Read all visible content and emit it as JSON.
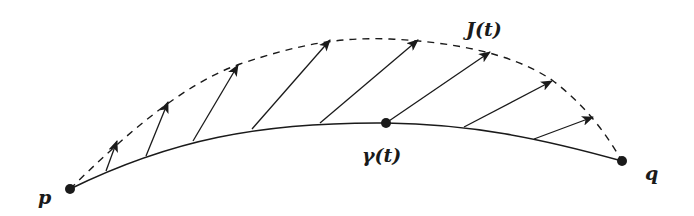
{
  "figure": {
    "colors": {
      "ink": "#1a1a1a",
      "background": "#ffffff"
    },
    "labels": {
      "start_point": "p",
      "end_point": "q",
      "curve_point": "γ(t)",
      "field": "J(t)"
    },
    "curve": {
      "type": "solid",
      "path": "M70,189 C170,140 260,122 386,123 C470,124 540,138 622,161"
    },
    "envelope": {
      "type": "dashed",
      "path": "M70,189 C120,140 180,85 240,64 C300,44 340,37 390,39 C450,42 510,52 552,80 C585,105 605,132 622,161"
    },
    "points": [
      {
        "name": "p",
        "x": 70,
        "y": 189
      },
      {
        "name": "gamma-t",
        "x": 386,
        "y": 123
      },
      {
        "name": "q",
        "x": 622,
        "y": 161
      }
    ],
    "label_positions": {
      "p": {
        "x": 38,
        "y": 204
      },
      "q": {
        "x": 645,
        "y": 180
      },
      "gamma": {
        "x": 362,
        "y": 162
      },
      "J": {
        "x": 466,
        "y": 36
      }
    },
    "vectors": [
      {
        "x1": 106,
        "y1": 171,
        "x2": 117,
        "y2": 141
      },
      {
        "x1": 146,
        "y1": 156,
        "x2": 168,
        "y2": 102
      },
      {
        "x1": 193,
        "y1": 141,
        "x2": 238,
        "y2": 65
      },
      {
        "x1": 252,
        "y1": 129,
        "x2": 330,
        "y2": 40
      },
      {
        "x1": 320,
        "y1": 123,
        "x2": 418,
        "y2": 40
      },
      {
        "x1": 386,
        "y1": 123,
        "x2": 490,
        "y2": 52
      },
      {
        "x1": 464,
        "y1": 127,
        "x2": 552,
        "y2": 81
      },
      {
        "x1": 534,
        "y1": 139,
        "x2": 593,
        "y2": 117
      }
    ]
  }
}
